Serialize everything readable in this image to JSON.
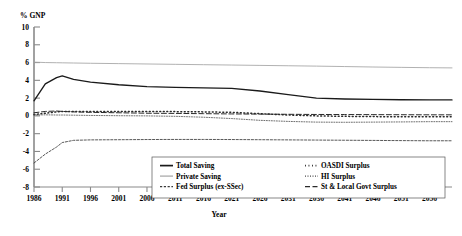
{
  "chart_data": {
    "type": "line",
    "title": "",
    "xlabel": "Year",
    "ylabel": "% GNP",
    "xlim": [
      1986,
      2060
    ],
    "ylim": [
      -8,
      10
    ],
    "grid": false,
    "legend_position": "bottom-center",
    "xticks": [
      1986,
      1991,
      1996,
      2001,
      2006,
      2011,
      2016,
      2021,
      2026,
      2031,
      2036,
      2041,
      2046,
      2051,
      2056
    ],
    "yticks": [
      10,
      8,
      6,
      4,
      2,
      0,
      -2,
      -4,
      -6,
      -8
    ],
    "x": [
      1986,
      1988,
      1990,
      1991,
      1993,
      1996,
      2001,
      2006,
      2011,
      2016,
      2021,
      2026,
      2031,
      2036,
      2041,
      2046,
      2051,
      2056,
      2060
    ],
    "series": [
      {
        "name": "Total Saving",
        "style": "solid-thick",
        "values": [
          1.7,
          3.6,
          4.3,
          4.5,
          4.1,
          3.8,
          3.5,
          3.3,
          3.2,
          3.15,
          3.1,
          2.8,
          2.4,
          2.0,
          1.9,
          1.85,
          1.82,
          1.8,
          1.8
        ]
      },
      {
        "name": "Private Saving",
        "style": "solid-thin",
        "values": [
          6.05,
          6.0,
          5.98,
          5.97,
          5.95,
          5.92,
          5.88,
          5.84,
          5.8,
          5.76,
          5.72,
          5.68,
          5.64,
          5.6,
          5.55,
          5.5,
          5.46,
          5.42,
          5.4
        ]
      },
      {
        "name": "Fed Surplus (ex-SSec)",
        "style": "dashed",
        "values": [
          -5.3,
          -4.3,
          -3.5,
          -3.0,
          -2.75,
          -2.7,
          -2.68,
          -2.66,
          -2.65,
          -2.65,
          -2.66,
          -2.68,
          -2.7,
          -2.72,
          -2.74,
          -2.76,
          -2.78,
          -2.8,
          -2.8
        ]
      },
      {
        "name": "OASDI Surplus",
        "style": "dotted-dense",
        "values": [
          0.15,
          0.3,
          0.45,
          0.5,
          0.5,
          0.5,
          0.5,
          0.5,
          0.48,
          0.45,
          0.4,
          0.25,
          0.1,
          0.0,
          -0.05,
          -0.08,
          -0.1,
          -0.1,
          -0.1
        ]
      },
      {
        "name": "HI Surplus",
        "style": "dotted-fine",
        "values": [
          0.1,
          0.12,
          0.1,
          0.1,
          0.08,
          0.05,
          0.02,
          0.0,
          -0.05,
          -0.15,
          -0.3,
          -0.5,
          -0.62,
          -0.7,
          -0.72,
          -0.7,
          -0.68,
          -0.65,
          -0.65
        ]
      },
      {
        "name": "St & Local Govt Surplus",
        "style": "solid-mark",
        "values": [
          0.35,
          0.5,
          0.55,
          0.5,
          0.45,
          0.4,
          0.35,
          0.3,
          0.28,
          0.25,
          0.22,
          0.2,
          0.18,
          0.16,
          0.15,
          0.14,
          0.13,
          0.12,
          0.12
        ]
      }
    ],
    "legend": [
      {
        "label": "Total Saving",
        "style": "solid-thick"
      },
      {
        "label": "Private Saving",
        "style": "solid-thin"
      },
      {
        "label": "Fed Surplus (ex-SSec)",
        "style": "dashed"
      },
      {
        "label": "OASDI Surplus",
        "style": "dotted-dense"
      },
      {
        "label": "HI Surplus",
        "style": "dotted-fine"
      },
      {
        "label": "St & Local Govt Surplus",
        "style": "solid-mark"
      }
    ],
    "colors": {
      "line": "#000000",
      "private_saving": "#9a9a9a",
      "axis": "#666666"
    }
  }
}
